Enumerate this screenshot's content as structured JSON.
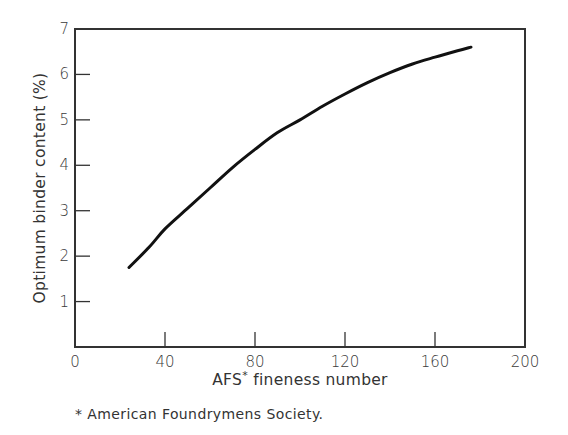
{
  "chart_data": {
    "type": "line",
    "title": "",
    "xlabel": "AFS* fineness number",
    "xlabel_main": "AFS",
    "xlabel_super": "*",
    "xlabel_rest": " fineness number",
    "ylabel": "Optimum binder content  (%)",
    "xlim": [
      0,
      200
    ],
    "ylim": [
      0,
      7
    ],
    "xticks": [
      0,
      40,
      80,
      120,
      160,
      200
    ],
    "yticks": [
      1,
      2,
      3,
      4,
      5,
      6,
      7
    ],
    "grid": false,
    "legend": null,
    "series": [
      {
        "name": "Optimum binder content",
        "x": [
          24,
          33,
          40,
          50,
          60,
          70,
          80,
          90,
          100,
          110,
          120,
          130,
          140,
          150,
          160,
          170,
          176
        ],
        "y": [
          1.75,
          2.2,
          2.6,
          3.05,
          3.5,
          3.95,
          4.35,
          4.72,
          5.0,
          5.3,
          5.57,
          5.82,
          6.04,
          6.23,
          6.38,
          6.52,
          6.6
        ]
      }
    ],
    "footnote": "* American Foundrymens Society.",
    "colors": {
      "line": "#111111",
      "axes": "#333333",
      "background": "#ffffff"
    }
  }
}
